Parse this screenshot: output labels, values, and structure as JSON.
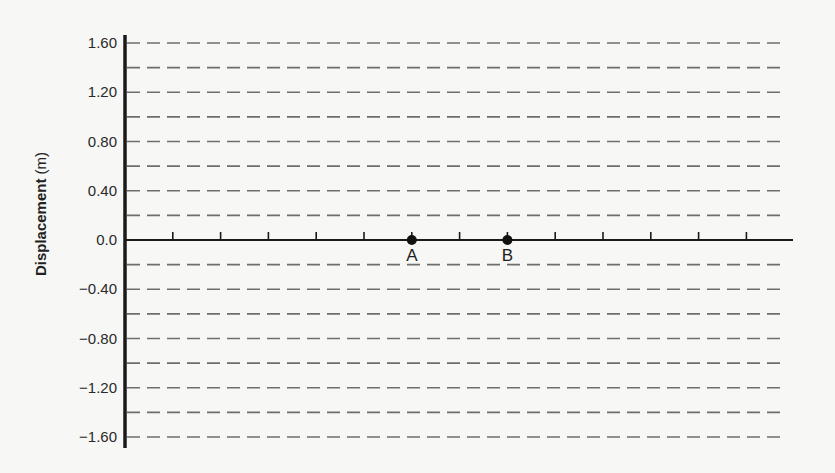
{
  "chart_data": {
    "type": "line",
    "title": "",
    "xlabel": "",
    "ylabel": "Displacement (m)",
    "ylabel_bold": "Displacement",
    "ylabel_unit": "(m)",
    "ylim": [
      -1.6,
      1.6
    ],
    "y_ticks": [
      1.6,
      1.2,
      0.8,
      0.4,
      0.0,
      -0.4,
      -0.8,
      -1.2,
      -1.6
    ],
    "y_tick_labels": [
      "1.60",
      "1.20",
      "0.80",
      "0.40",
      "0.0",
      "−0.40",
      "−0.80",
      "−1.20",
      "−1.60"
    ],
    "gridlines": {
      "style": "dashed",
      "step": 0.2,
      "count": 17
    },
    "x_tick_count": 13,
    "points": [
      {
        "label": "A",
        "x_tick_index": 6,
        "y": 0.0
      },
      {
        "label": "B",
        "x_tick_index": 8,
        "y": 0.0
      }
    ],
    "legend": null
  },
  "colors": {
    "background": "#f7f7f5",
    "axis": "#1a1a1a",
    "grid": "#6e6e6e",
    "point": "#111111"
  }
}
